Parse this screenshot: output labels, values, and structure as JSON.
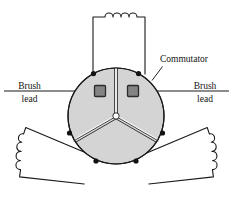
{
  "figure": {
    "labels": {
      "commutator": "Commutator",
      "brush_left_line1": "Brush",
      "brush_left_line2": "lead",
      "brush_right_line1": "Brush",
      "brush_right_line2": "lead"
    },
    "colors": {
      "background": "#ffffff",
      "segment_fill": "#d4d4d4",
      "outline": "#1a1a1a",
      "brush_fill": "#848484",
      "brush_border": "#2b2b2b",
      "coil_fill": "#ffffff",
      "node_fill": "#111111",
      "hub_fill": "#ffffff",
      "text": "#141414"
    },
    "geometry": {
      "width": 233,
      "height": 205,
      "disc_center_x": 116,
      "disc_center_y": 116,
      "disc_radius": 48,
      "gap_angles_deg": [
        90,
        210,
        330
      ],
      "segment_count": 3,
      "brush_count": 2,
      "coil_count": 3,
      "connection_node_count": 6,
      "top_coil_hump_count": 4,
      "side_coil_hump_count": 4,
      "brush_line_y": 91
    },
    "parts": [
      {
        "name": "commutator-disc",
        "kind": "disc",
        "segments": 3
      },
      {
        "name": "brush-left",
        "kind": "brush-contact"
      },
      {
        "name": "brush-right",
        "kind": "brush-contact"
      },
      {
        "name": "coil-top",
        "kind": "armature-coil"
      },
      {
        "name": "coil-bottom-left",
        "kind": "armature-coil"
      },
      {
        "name": "coil-bottom-right",
        "kind": "armature-coil"
      }
    ]
  }
}
